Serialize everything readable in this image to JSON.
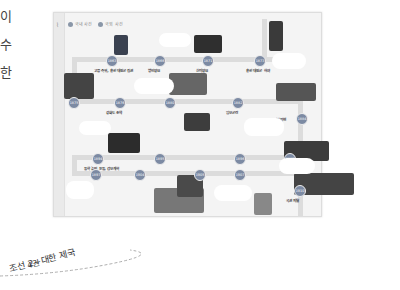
{
  "left_fragments": [
    "이",
    "수",
    "한"
  ],
  "book": {
    "volume": "4권",
    "subtitle": "조선 2~대한 제국"
  },
  "legend": [
    {
      "label": "국내 사건"
    },
    {
      "label": "국외 사건"
    }
  ],
  "timeline": [
    {
      "year": "1863",
      "label": "고종 즉위, 흥선 대원군 집권"
    },
    {
      "year": "1866",
      "label": "병인양요"
    },
    {
      "year": "1868",
      "label": "오페르트 도굴 사건"
    },
    {
      "year": "1871",
      "label": "신미양요"
    },
    {
      "year": "1873",
      "label": "흥선 대원군 하야"
    },
    {
      "year": "1875",
      "label": "운요호 사건"
    },
    {
      "year": "1876",
      "label": "강화도 조약"
    },
    {
      "year": "1880",
      "label": "통리기무아문 설치"
    },
    {
      "year": "1882",
      "label": "임오군란"
    },
    {
      "year": "1884",
      "label": "갑신정변"
    },
    {
      "year": "1885",
      "label": "거문도 사건"
    },
    {
      "year": "1894",
      "label": "동학 농민 운동, 갑오개혁"
    },
    {
      "year": "1895",
      "label": "을미사변"
    },
    {
      "year": "1896",
      "label": "아관 파천"
    },
    {
      "year": "1897",
      "label": "대한 제국 수립"
    },
    {
      "year": "1904",
      "label": "러일 전쟁"
    },
    {
      "year": "1905",
      "label": "을사늑약"
    },
    {
      "year": "1907",
      "label": "헤이그 특사 파견"
    },
    {
      "year": "1910",
      "label": "국권 피탈"
    }
  ]
}
